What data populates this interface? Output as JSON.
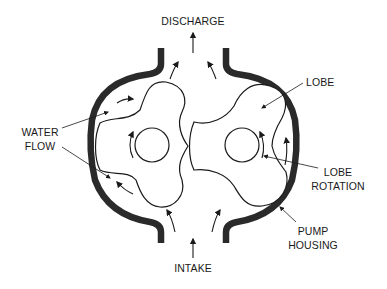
{
  "diagram": {
    "labels": {
      "discharge": "DISCHARGE",
      "intake": "INTAKE",
      "lobe": "LOBE",
      "water_flow_line1": "WATER",
      "water_flow_line2": "FLOW",
      "lobe_rotation_line1": "LOBE",
      "lobe_rotation_line2": "ROTATION",
      "pump_housing_line1": "PUMP",
      "pump_housing_line2": "HOUSING"
    },
    "colors": {
      "background": "#ffffff",
      "housing": "#2a2a2a",
      "line": "#1a1a1a"
    }
  }
}
